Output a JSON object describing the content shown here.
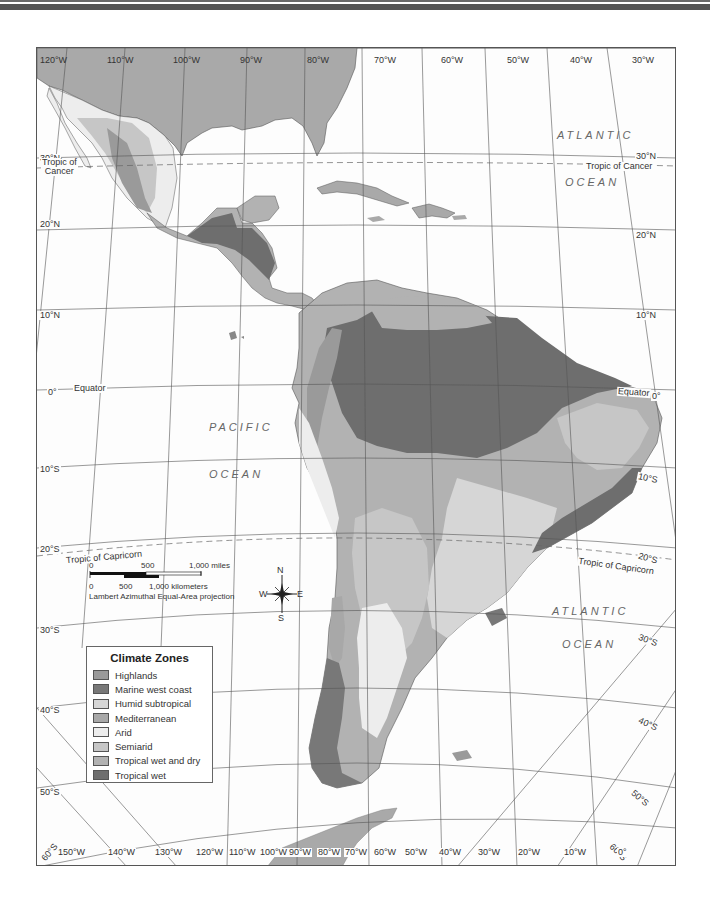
{
  "map": {
    "title": "Climate Zones",
    "projection": "Lambert Azimuthal Equal-Area projection",
    "oceans": [
      {
        "line1": "ATLANTIC",
        "line2": "OCEAN",
        "position": "north-east"
      },
      {
        "line1": "PACIFIC",
        "line2": "OCEAN",
        "position": "west"
      },
      {
        "line1": "ATLANTIC",
        "line2": "OCEAN",
        "position": "south-east"
      }
    ],
    "reference_lines": {
      "tropic_cancer_left": "Tropic of\nCancer",
      "tropic_cancer_left_1": "Tropic of",
      "tropic_cancer_left_2": "Cancer",
      "tropic_cancer_right": "Tropic of Cancer",
      "equator_left": "Equator",
      "equator_right": "Equator",
      "tropic_capricorn_left": "Tropic of Capricorn",
      "tropic_capricorn_right": "Tropic of Capricorn"
    },
    "longitude_top": [
      "120°W",
      "110°W",
      "100°W",
      "90°W",
      "80°W",
      "70°W",
      "60°W",
      "50°W",
      "40°W",
      "30°W"
    ],
    "longitude_bottom": [
      "150°W",
      "140°W",
      "130°W",
      "120°W",
      "110°W",
      "100°W",
      "90°W",
      "80°W",
      "70°W",
      "60°W",
      "50°W",
      "40°W",
      "30°W",
      "20°W",
      "10°W",
      "0°"
    ],
    "latitude_left": [
      "30°N",
      "20°N",
      "10°N",
      "0°",
      "10°S",
      "20°S",
      "30°S",
      "40°S",
      "50°S",
      "60°S"
    ],
    "latitude_right": [
      "30°N",
      "20°N",
      "10°N",
      "0°",
      "10°S",
      "20°S",
      "30°S",
      "40°S",
      "50°S",
      "60°S"
    ]
  },
  "scale_bar": {
    "miles_ticks": [
      "0",
      "500",
      "1,000 miles"
    ],
    "km_ticks": [
      "0",
      "500",
      "1,000 kilometers"
    ],
    "projection_note": "Lambert Azimuthal Equal-Area projection"
  },
  "compass": {
    "n": "N",
    "s": "S",
    "e": "E",
    "w": "W"
  },
  "legend": {
    "title": "Climate Zones",
    "items": [
      {
        "label": "Highlands",
        "color": "#9a9a9a"
      },
      {
        "label": "Marine west coast",
        "color": "#787878"
      },
      {
        "label": "Humid subtropical",
        "color": "#d6d6d6"
      },
      {
        "label": "Mediterranean",
        "color": "#a8a8a8"
      },
      {
        "label": "Arid",
        "color": "#ededed"
      },
      {
        "label": "Semiarid",
        "color": "#c6c6c6"
      },
      {
        "label": "Tropical wet and dry",
        "color": "#b2b2b2"
      },
      {
        "label": "Tropical wet",
        "color": "#6e6e6e"
      }
    ]
  },
  "colors": {
    "land_other": "#a9a9a9",
    "ocean": "#fdfdfd",
    "grid": "#555555",
    "border": "#333333"
  }
}
